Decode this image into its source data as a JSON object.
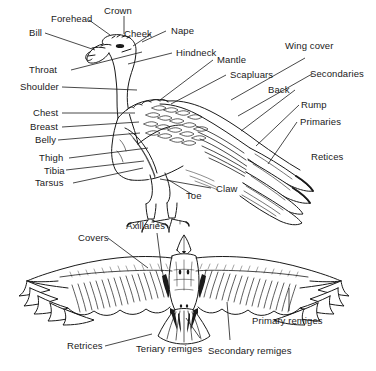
{
  "diagram": {
    "background_color": "#ffffff",
    "line_color": "#1a1a1a",
    "text_color": "#1a1a1a",
    "figures": [
      {
        "name": "perched-vulture-side-view",
        "description": "Side profile of a perched vulture with labeled external parts"
      },
      {
        "name": "vulture-underside-flight-view",
        "description": "Underside view of a vulture in flight with wings spread and labeled feather tracts"
      }
    ]
  },
  "top_figure": {
    "labels": [
      {
        "id": "forehead",
        "text": "Forehead"
      },
      {
        "id": "crown",
        "text": "Crown"
      },
      {
        "id": "bill",
        "text": "Bill"
      },
      {
        "id": "cheek",
        "text": "Cheek"
      },
      {
        "id": "nape",
        "text": "Nape"
      },
      {
        "id": "hindneck",
        "text": "Hindneck"
      },
      {
        "id": "mantle",
        "text": "Mantle"
      },
      {
        "id": "throat",
        "text": "Throat"
      },
      {
        "id": "scapluars",
        "text": "Scapluars"
      },
      {
        "id": "wing-cover",
        "text": "Wing cover"
      },
      {
        "id": "secondaries",
        "text": "Secondaries"
      },
      {
        "id": "shoulder",
        "text": "Shoulder"
      },
      {
        "id": "back",
        "text": "Back"
      },
      {
        "id": "rump",
        "text": "Rump"
      },
      {
        "id": "chest",
        "text": "Chest"
      },
      {
        "id": "breast",
        "text": "Breast"
      },
      {
        "id": "primaries",
        "text": "Primaries"
      },
      {
        "id": "belly",
        "text": "Belly"
      },
      {
        "id": "retices",
        "text": "Retices"
      },
      {
        "id": "thigh",
        "text": "Thigh"
      },
      {
        "id": "tibia",
        "text": "Tibia"
      },
      {
        "id": "tarsus",
        "text": "Tarsus"
      },
      {
        "id": "toe",
        "text": "Toe"
      },
      {
        "id": "claw",
        "text": "Claw"
      }
    ]
  },
  "bottom_figure": {
    "labels": [
      {
        "id": "covers",
        "text": "Covers"
      },
      {
        "id": "axillaries",
        "text": "Axillaries"
      },
      {
        "id": "primary-remiges",
        "text": "Primary remiges"
      },
      {
        "id": "retrices",
        "text": "Retrices"
      },
      {
        "id": "teriary-remiges",
        "text": "Teriary remiges"
      },
      {
        "id": "secondary-remiges",
        "text": "Secondary remiges"
      }
    ]
  }
}
